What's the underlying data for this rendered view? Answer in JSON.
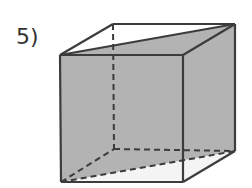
{
  "problem": {
    "number_label": "5)"
  },
  "figure": {
    "type": "cube-with-diagonal-cross-section",
    "colors": {
      "shade": "#b3b3b3",
      "edge": "#3c3c3c",
      "background": "#ffffff",
      "light_face": "#f4f4f4"
    },
    "vertices": {
      "front_top_left": [
        60,
        55
      ],
      "front_top_right": [
        183,
        55
      ],
      "front_bottom_left": [
        61,
        182
      ],
      "front_bottom_right": [
        183,
        182
      ],
      "back_top_left": [
        113,
        24
      ],
      "back_top_right": [
        235,
        24
      ],
      "back_bottom_left": [
        114,
        149
      ],
      "back_bottom_right": [
        235,
        151
      ]
    },
    "hidden_edges_dashed": true
  }
}
